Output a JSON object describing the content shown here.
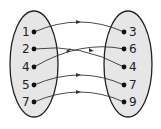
{
  "diagram": {
    "type": "mapping",
    "colors": {
      "fill": "#e6e6e6",
      "stroke": "#222222",
      "arrow": "#333333"
    },
    "domain": {
      "items": [
        {
          "label": "1",
          "y": 32
        },
        {
          "label": "2",
          "y": 49
        },
        {
          "label": "4",
          "y": 67
        },
        {
          "label": "5",
          "y": 85
        },
        {
          "label": "7",
          "y": 102
        }
      ]
    },
    "range": {
      "items": [
        {
          "label": "3",
          "y": 32
        },
        {
          "label": "6",
          "y": 49
        },
        {
          "label": "4",
          "y": 67
        },
        {
          "label": "7",
          "y": 85
        },
        {
          "label": "9",
          "y": 102
        }
      ]
    },
    "mappings": [
      {
        "from": "1",
        "to": "3"
      },
      {
        "from": "2",
        "to": "4"
      },
      {
        "from": "4",
        "to": "6"
      },
      {
        "from": "5",
        "to": "7"
      },
      {
        "from": "7",
        "to": "9"
      }
    ]
  }
}
